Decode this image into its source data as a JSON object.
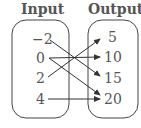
{
  "headers": {
    "input": "Input",
    "output": "Output"
  },
  "inputs": [
    "−2",
    "0",
    "2",
    "4"
  ],
  "outputs": [
    "5",
    "10",
    "15",
    "20"
  ],
  "mappings": [
    {
      "from": "-2",
      "to": "15"
    },
    {
      "from": "0",
      "to": "10"
    },
    {
      "from": "0",
      "to": "20"
    },
    {
      "from": "2",
      "to": "5"
    },
    {
      "from": "4",
      "to": "20"
    }
  ],
  "colors": {
    "stroke": "#333333",
    "text": "#555555"
  }
}
